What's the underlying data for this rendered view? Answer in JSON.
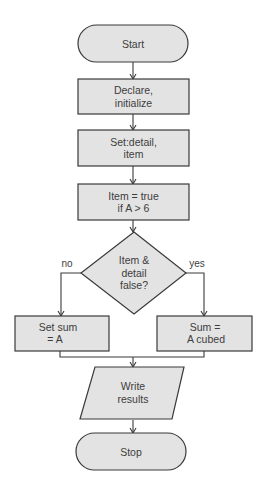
{
  "diagram": {
    "type": "flowchart",
    "colors": {
      "node_fill": "#e3e3e3",
      "stroke": "#3a3a3a",
      "text": "#3d3d3d",
      "background": "#ffffff"
    },
    "nodes": {
      "start": {
        "shape": "terminal",
        "lines": [
          "Start"
        ]
      },
      "declare": {
        "shape": "process",
        "lines": [
          "Declare,",
          "initialize"
        ]
      },
      "set_detail": {
        "shape": "process",
        "lines": [
          "Set:detail,",
          "item"
        ]
      },
      "item_true": {
        "shape": "process",
        "lines": [
          "Item = true",
          "if A > 6"
        ]
      },
      "decision": {
        "shape": "decision",
        "lines": [
          "Item &",
          "detail",
          "false?"
        ]
      },
      "set_sum": {
        "shape": "process",
        "lines": [
          "Set sum",
          "= A"
        ]
      },
      "sum_cubed": {
        "shape": "process",
        "lines": [
          "Sum =",
          "A cubed"
        ]
      },
      "write": {
        "shape": "io",
        "lines": [
          "Write",
          "results"
        ]
      },
      "stop": {
        "shape": "terminal",
        "lines": [
          "Stop"
        ]
      }
    },
    "edges": [
      {
        "from": "start",
        "to": "declare",
        "label": ""
      },
      {
        "from": "declare",
        "to": "set_detail",
        "label": ""
      },
      {
        "from": "set_detail",
        "to": "item_true",
        "label": ""
      },
      {
        "from": "item_true",
        "to": "decision",
        "label": ""
      },
      {
        "from": "decision",
        "to": "set_sum",
        "label": "no"
      },
      {
        "from": "decision",
        "to": "sum_cubed",
        "label": "yes"
      },
      {
        "from": "set_sum",
        "to": "write",
        "label": ""
      },
      {
        "from": "sum_cubed",
        "to": "write",
        "label": ""
      },
      {
        "from": "write",
        "to": "stop",
        "label": ""
      }
    ],
    "edge_labels": {
      "no": "no",
      "yes": "yes"
    }
  }
}
